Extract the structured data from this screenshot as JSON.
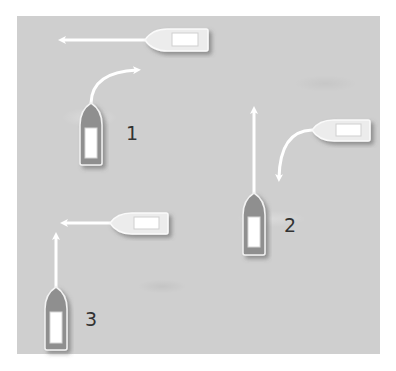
{
  "diagram": {
    "background_color": "#cfcfcf",
    "scenarios": [
      {
        "label": "1",
        "label_pos": {
          "x": 126,
          "y": 122
        },
        "boats": [
          {
            "orientation": "horizontal-left",
            "color": "light",
            "x": 145,
            "y": 28,
            "w": 63,
            "h": 24,
            "path": "straight-left"
          },
          {
            "orientation": "vertical-up",
            "color": "gray",
            "x": 80,
            "y": 103,
            "w": 22,
            "h": 62,
            "path": "curve-right"
          }
        ]
      },
      {
        "label": "2",
        "label_pos": {
          "x": 284,
          "y": 214
        },
        "boats": [
          {
            "orientation": "vertical-up",
            "color": "gray",
            "x": 243,
            "y": 193,
            "w": 22,
            "h": 62,
            "path": "straight-up"
          },
          {
            "orientation": "horizontal-left",
            "color": "light",
            "x": 312,
            "y": 119,
            "w": 58,
            "h": 23,
            "path": "curve-down"
          }
        ]
      },
      {
        "label": "3",
        "label_pos": {
          "x": 85,
          "y": 308
        },
        "boats": [
          {
            "orientation": "horizontal-left",
            "color": "light",
            "x": 110,
            "y": 212,
            "w": 58,
            "h": 23,
            "path": "straight-left"
          },
          {
            "orientation": "vertical-up",
            "color": "gray",
            "x": 45,
            "y": 287,
            "w": 22,
            "h": 63,
            "path": "straight-up"
          }
        ]
      }
    ],
    "colors": {
      "gray_hull": "#8f8f8f",
      "light_hull": "#ececec",
      "cabin": "#ffffff",
      "arrow": "#ffffff",
      "outline": "#f4f4f4",
      "shadow": "#6e6e6e"
    }
  }
}
